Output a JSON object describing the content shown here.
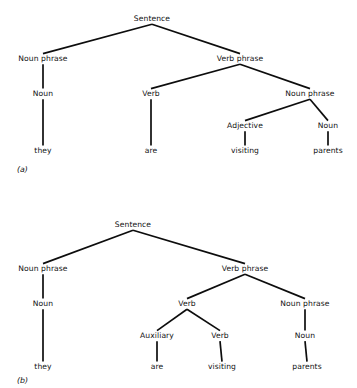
{
  "figure": {
    "background_color": "#ffffff",
    "line_color": "#0d0d0d",
    "text_color": "#121212",
    "sentence_words": [
      "they",
      "are",
      "visiting",
      "parents"
    ],
    "panels": [
      {
        "id": "a",
        "caption": "(a)",
        "caption_x": 17,
        "caption_y": 172,
        "reading": "they are visiting-parents (adjective reading)",
        "nodes": [
          {
            "id": "a-s",
            "label": "Sentence",
            "x": 152,
            "y": 21,
            "level": 0
          },
          {
            "id": "a-np1",
            "label": "Noun phrase",
            "x": 43,
            "y": 61,
            "level": 1
          },
          {
            "id": "a-vp",
            "label": "Verb phrase",
            "x": 240,
            "y": 61,
            "level": 1
          },
          {
            "id": "a-n1",
            "label": "Noun",
            "x": 43,
            "y": 96,
            "level": 2
          },
          {
            "id": "a-v",
            "label": "Verb",
            "x": 151,
            "y": 96,
            "level": 2
          },
          {
            "id": "a-np2",
            "label": "Noun phrase",
            "x": 310,
            "y": 96,
            "level": 2
          },
          {
            "id": "a-adj",
            "label": "Adjective",
            "x": 245,
            "y": 128,
            "level": 3
          },
          {
            "id": "a-n2",
            "label": "Noun",
            "x": 328,
            "y": 128,
            "level": 3
          }
        ],
        "leaves": [
          {
            "id": "a-l1",
            "label": "they",
            "x": 43,
            "y": 153,
            "parent": "a-n1"
          },
          {
            "id": "a-l2",
            "label": "are",
            "x": 151,
            "y": 153,
            "parent": "a-v"
          },
          {
            "id": "a-l3",
            "label": "visiting",
            "x": 245,
            "y": 153,
            "parent": "a-adj"
          },
          {
            "id": "a-l4",
            "label": "parents",
            "x": 328,
            "y": 153,
            "parent": "a-n2"
          }
        ],
        "edges": [
          {
            "from": "a-s",
            "to": "a-np1"
          },
          {
            "from": "a-s",
            "to": "a-vp"
          },
          {
            "from": "a-np1",
            "to": "a-n1"
          },
          {
            "from": "a-vp",
            "to": "a-v"
          },
          {
            "from": "a-vp",
            "to": "a-np2"
          },
          {
            "from": "a-np2",
            "to": "a-adj"
          },
          {
            "from": "a-np2",
            "to": "a-n2"
          },
          {
            "from": "a-n1",
            "to": "a-l1"
          },
          {
            "from": "a-v",
            "to": "a-l2"
          },
          {
            "from": "a-adj",
            "to": "a-l3"
          },
          {
            "from": "a-n2",
            "to": "a-l4"
          }
        ]
      },
      {
        "id": "b",
        "caption": "(b)",
        "caption_x": 17,
        "caption_y": 383,
        "reading": "they are-visiting parents (auxiliary + verb reading)",
        "nodes": [
          {
            "id": "b-s",
            "label": "Sentence",
            "x": 133,
            "y": 227,
            "level": 0
          },
          {
            "id": "b-np1",
            "label": "Noun phrase",
            "x": 43,
            "y": 271,
            "level": 1
          },
          {
            "id": "b-vp",
            "label": "Verb phrase",
            "x": 245,
            "y": 271,
            "level": 1
          },
          {
            "id": "b-n1",
            "label": "Noun",
            "x": 43,
            "y": 306,
            "level": 2
          },
          {
            "id": "b-v1",
            "label": "Verb",
            "x": 187,
            "y": 306,
            "level": 2
          },
          {
            "id": "b-np2",
            "label": "Noun phrase",
            "x": 305,
            "y": 306,
            "level": 2
          },
          {
            "id": "b-aux",
            "label": "Auxiliary",
            "x": 157,
            "y": 338,
            "level": 3
          },
          {
            "id": "b-v2",
            "label": "Verb",
            "x": 220,
            "y": 338,
            "level": 3
          },
          {
            "id": "b-n2",
            "label": "Noun",
            "x": 305,
            "y": 338,
            "level": 3
          }
        ],
        "leaves": [
          {
            "id": "b-l1",
            "label": "they",
            "x": 43,
            "y": 369,
            "parent": "b-n1"
          },
          {
            "id": "b-l2",
            "label": "are",
            "x": 157,
            "y": 369,
            "parent": "b-aux"
          },
          {
            "id": "b-l3",
            "label": "visiting",
            "x": 222,
            "y": 369,
            "parent": "b-v2"
          },
          {
            "id": "b-l4",
            "label": "parents",
            "x": 307,
            "y": 369,
            "parent": "b-n2"
          }
        ],
        "edges": [
          {
            "from": "b-s",
            "to": "b-np1"
          },
          {
            "from": "b-s",
            "to": "b-vp"
          },
          {
            "from": "b-np1",
            "to": "b-n1"
          },
          {
            "from": "b-vp",
            "to": "b-v1"
          },
          {
            "from": "b-vp",
            "to": "b-np2"
          },
          {
            "from": "b-v1",
            "to": "b-aux"
          },
          {
            "from": "b-v1",
            "to": "b-v2"
          },
          {
            "from": "b-np2",
            "to": "b-n2"
          },
          {
            "from": "b-n1",
            "to": "b-l1"
          },
          {
            "from": "b-aux",
            "to": "b-l2"
          },
          {
            "from": "b-v2",
            "to": "b-l3"
          },
          {
            "from": "b-n2",
            "to": "b-l4"
          }
        ]
      }
    ]
  }
}
